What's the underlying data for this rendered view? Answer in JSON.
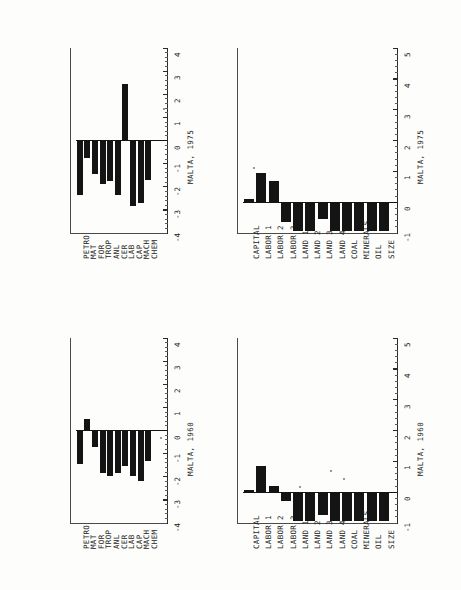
{
  "figure": {
    "orientation": "rotated-90",
    "background": "#fdfdfb",
    "ink_color": "#141414",
    "panel_count": 4
  },
  "chart_data": [
    {
      "id": "commodity-1975",
      "type": "bar",
      "title": "MALTA, 1975",
      "xlabel": "",
      "ylabel": "",
      "orientation": "horizontal-rotated",
      "grid": false,
      "legend": "none",
      "ylim": [
        -4,
        4
      ],
      "yticks": [
        -4,
        -3,
        -2,
        -1,
        0,
        1,
        2,
        3,
        4
      ],
      "ticklabels": [
        "-4",
        "-3",
        "-2",
        "-1",
        "0",
        "1",
        "2",
        "3",
        "4"
      ],
      "categories": [
        "PETRO",
        "MAT",
        "FOR",
        "TROP",
        "ANL",
        "CER",
        "LAB",
        "CAP",
        "MACH",
        "CHEM"
      ],
      "values": [
        -2.35,
        -0.75,
        -1.45,
        -1.9,
        -1.75,
        -2.35,
        2.45,
        -2.85,
        -2.7,
        -1.7
      ]
    },
    {
      "id": "commodity-1960",
      "type": "bar",
      "title": "MALTA, 1960",
      "xlabel": "",
      "ylabel": "",
      "orientation": "horizontal-rotated",
      "grid": false,
      "legend": "none",
      "ylim": [
        -4,
        4
      ],
      "yticks": [
        -4,
        -3,
        -2,
        -1,
        0,
        1,
        2,
        3,
        4
      ],
      "ticklabels": [
        "-4",
        "-3",
        "-2",
        "-1",
        "0",
        "1",
        "2",
        "3",
        "4"
      ],
      "categories": [
        "PETRO",
        "MAT",
        "FOR",
        "TROP",
        "ANL",
        "CER",
        "LAB",
        "CAP",
        "MACH",
        "CHEM"
      ],
      "values": [
        -1.45,
        0.5,
        -0.7,
        -1.85,
        -1.95,
        -1.85,
        -1.55,
        -1.95,
        -2.2,
        -1.3
      ]
    },
    {
      "id": "endowment-1975",
      "type": "bar",
      "title": "MALTA, 1975",
      "xlabel": "",
      "ylabel": "",
      "orientation": "horizontal-rotated",
      "grid": false,
      "legend": "none",
      "ylim": [
        -1,
        5
      ],
      "yticks": [
        -1,
        0,
        1,
        2,
        3,
        4,
        5
      ],
      "ticklabels": [
        "-1",
        "0",
        "1",
        "2",
        "3",
        "4",
        "5"
      ],
      "categories": [
        "CAPITAL",
        "LABOR 1",
        "LABOR 2",
        "LABOR 3",
        "LAND 1",
        "LAND 2",
        "LAND 3",
        "LAND 4",
        "COAL",
        "MINERALS",
        "OIL",
        "SIZE"
      ],
      "values": [
        0.1,
        0.95,
        0.7,
        -0.65,
        -0.95,
        -0.95,
        -0.55,
        -0.95,
        -0.95,
        -0.95,
        -0.95,
        -0.95
      ]
    },
    {
      "id": "endowment-1960",
      "type": "bar",
      "title": "MALTA, 1960",
      "xlabel": "",
      "ylabel": "",
      "orientation": "horizontal-rotated",
      "grid": false,
      "legend": "none",
      "ylim": [
        -1,
        5
      ],
      "yticks": [
        -1,
        0,
        1,
        2,
        3,
        4,
        5
      ],
      "ticklabels": [
        "-1",
        "0",
        "1",
        "2",
        "3",
        "4",
        "5"
      ],
      "categories": [
        "CAPITAL",
        "LABOR 1",
        "LABOR 2",
        "LABOR 3",
        "LAND 1",
        "LAND 2",
        "LAND 3",
        "LAND 4",
        "COAL",
        "MINERALS",
        "OIL",
        "SIZE"
      ],
      "values": [
        0.08,
        0.85,
        0.2,
        -0.3,
        -0.95,
        -0.95,
        -0.75,
        -0.95,
        -0.95,
        -0.95,
        -0.95,
        -0.95
      ]
    }
  ]
}
